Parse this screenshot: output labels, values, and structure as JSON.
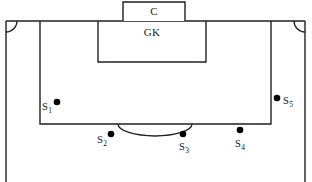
{
  "diagram": {
    "type": "field-schematic",
    "canvas": {
      "width": 312,
      "height": 182
    },
    "colors": {
      "line": "#231f20",
      "dot": "#000000",
      "background": "#ffffff",
      "text": "#111111"
    },
    "zones": [
      {
        "id": "goal",
        "label": "C",
        "name": "goal-box",
        "x": 123,
        "y": 2,
        "width": 62,
        "height": 19,
        "label_x": 154,
        "label_y": 5
      },
      {
        "id": "goal_area",
        "label": "GK",
        "name": "goal-area-box",
        "x": 98,
        "y": 21,
        "width": 108,
        "height": 41,
        "label_x": 152,
        "label_y": 26
      },
      {
        "id": "penalty_area",
        "label": "",
        "name": "penalty-area-box",
        "x": 40,
        "y": 21,
        "width": 231,
        "height": 103
      }
    ],
    "field_boundary": {
      "name": "field-boundary",
      "goal_line_y": 21,
      "left_touchline_x": 6,
      "right_touchline_x": 305,
      "bottom_y": 182
    },
    "corner_arcs": [
      {
        "name": "corner-arc-left",
        "cx": 6,
        "cy": 21,
        "r": 11
      },
      {
        "name": "corner-arc-right",
        "cx": 305,
        "cy": 21,
        "r": 11
      }
    ],
    "penalty_arc": {
      "name": "penalty-arc",
      "cx": 155,
      "cy": 124,
      "rx": 37,
      "ry": 12
    },
    "spots": [
      {
        "id": "S1",
        "label": "S",
        "subscript": "1",
        "dot_x": 57,
        "dot_y": 102,
        "label_x": 42,
        "label_y": 101,
        "label_side": "left"
      },
      {
        "id": "S2",
        "label": "S",
        "subscript": "2",
        "dot_x": 111,
        "dot_y": 134,
        "label_x": 97,
        "label_y": 134,
        "label_side": "left"
      },
      {
        "id": "S3",
        "label": "S",
        "subscript": "3",
        "dot_x": 183,
        "dot_y": 134,
        "label_x": 179,
        "label_y": 141,
        "label_side": "below"
      },
      {
        "id": "S4",
        "label": "S",
        "subscript": "4",
        "dot_x": 240,
        "dot_y": 130,
        "label_x": 235,
        "label_y": 138,
        "label_side": "below"
      },
      {
        "id": "S5",
        "label": "S",
        "subscript": "5",
        "dot_x": 277,
        "dot_y": 98,
        "label_x": 283,
        "label_y": 95,
        "label_side": "right"
      }
    ]
  }
}
